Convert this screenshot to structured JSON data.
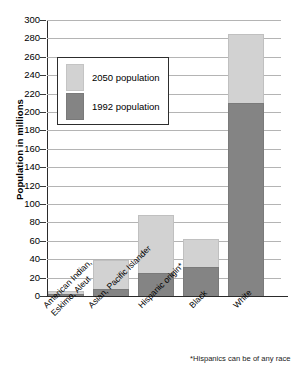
{
  "chart_data": {
    "type": "bar",
    "subtype": "stacked-vertical",
    "title": "",
    "xlabel": "",
    "ylabel": "Population in millions",
    "ylim": [
      0,
      300
    ],
    "ytick_step": 20,
    "ytick_labels": [
      "300",
      "280",
      "260",
      "240",
      "220",
      "200",
      "180",
      "160",
      "140",
      "120",
      "100",
      "80",
      "60",
      "40",
      "20",
      "0"
    ],
    "ytick_values": [
      300,
      280,
      260,
      240,
      220,
      200,
      180,
      160,
      140,
      120,
      100,
      80,
      60,
      40,
      20,
      0
    ],
    "grid": true,
    "grid_axis": "y",
    "legend_position": "upper-left-inset",
    "categories": [
      "American Indian,\nEskimo, Aleut",
      "Asian, Pacific Islander",
      "Hispanic origin*",
      "Black",
      "White"
    ],
    "category_labels": [
      {
        "line1": "American Indian,",
        "line2": "Eskimo, Aleut"
      },
      {
        "line1": "Asian, Pacific Islander",
        "line2": ""
      },
      {
        "line1": "Hispanic origin*",
        "line2": ""
      },
      {
        "line1": "Black",
        "line2": ""
      },
      {
        "line1": "White",
        "line2": ""
      }
    ],
    "series": [
      {
        "name": "1992 population",
        "color": "#848484",
        "values": [
          2,
          8,
          25,
          32,
          210
        ]
      },
      {
        "name": "2050 population",
        "color": "#d2d2d2",
        "values": [
          5,
          39,
          88,
          62,
          285
        ]
      }
    ],
    "stack_note": "Light segment tops indicate the 2050 projected total; dark segment is the 1992 population.",
    "annotations": [
      "*Hispanics can be of any race"
    ]
  },
  "legend": {
    "items": [
      {
        "label": "2050 population",
        "color": "#d2d2d2"
      },
      {
        "label": "1992 population",
        "color": "#848484"
      }
    ]
  },
  "axes": {
    "y_title": "Population in millions"
  },
  "footnote": "*Hispanics can be of any race",
  "colors": {
    "light_gray": "#d2d2d2",
    "dark_gray": "#848484",
    "gridline": "#b4b4b4",
    "axis": "#2b2b2b"
  }
}
